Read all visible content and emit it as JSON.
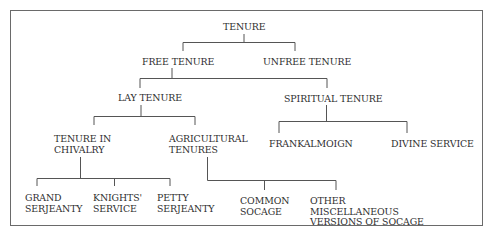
{
  "diagram": {
    "type": "tree",
    "nodes": {
      "root": {
        "label": "TENURE"
      },
      "free": {
        "label": "FREE TENURE"
      },
      "unfree": {
        "label": "UNFREE TENURE"
      },
      "lay": {
        "label": "LAY TENURE"
      },
      "spiritual": {
        "label": "SPIRITUAL TENURE"
      },
      "chivalry": {
        "label": "TENURE IN\nCHIVALRY"
      },
      "agricultural": {
        "label": "AGRICULTURAL\nTENURES"
      },
      "frankalmoign": {
        "label": "FRANKALMOIGN"
      },
      "divine": {
        "label": "DIVINE SERVICE"
      },
      "grand": {
        "label": "GRAND\nSERJEANTY"
      },
      "knights": {
        "label": "KNIGHTS'\nSERVICE"
      },
      "petty": {
        "label": "PETTY\nSERJEANTY"
      },
      "common": {
        "label": "COMMON\nSOCAGE"
      },
      "other": {
        "label": "OTHER\nMISCELLANEOUS\nVERSIONS OF SOCAGE"
      }
    },
    "edges": [
      [
        "root",
        "free"
      ],
      [
        "root",
        "unfree"
      ],
      [
        "free",
        "lay"
      ],
      [
        "free",
        "spiritual"
      ],
      [
        "lay",
        "chivalry"
      ],
      [
        "lay",
        "agricultural"
      ],
      [
        "spiritual",
        "frankalmoign"
      ],
      [
        "spiritual",
        "divine"
      ],
      [
        "chivalry",
        "grand"
      ],
      [
        "chivalry",
        "knights"
      ],
      [
        "chivalry",
        "petty"
      ],
      [
        "agricultural",
        "common"
      ],
      [
        "agricultural",
        "other"
      ]
    ]
  },
  "colors": {
    "text": "#2e2e2e",
    "line": "#555555",
    "border": "#6a6a6a"
  }
}
